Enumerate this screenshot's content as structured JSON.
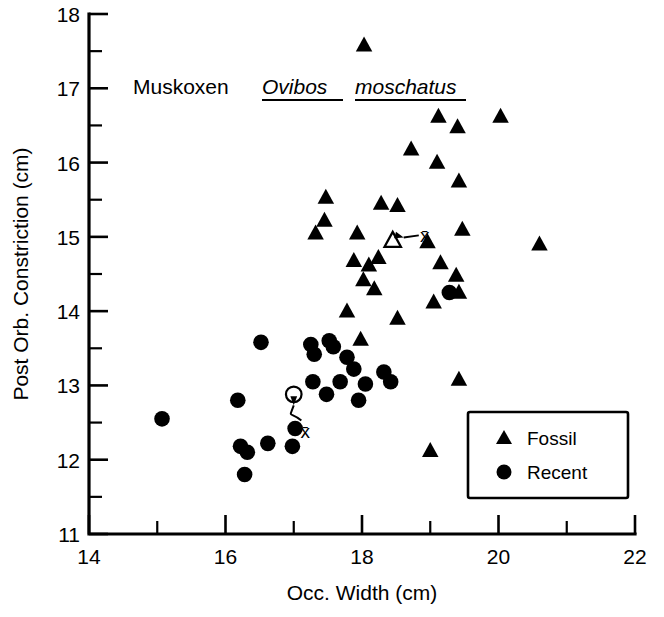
{
  "chart_data": {
    "type": "scatter",
    "title": "Muskoxen Ovibos moschatus",
    "title_plain": "Muskoxen",
    "title_italic": "Ovibos moschatus",
    "title_genus": "Ovibos",
    "title_species": "moschatus",
    "xlabel": "Occ. Width (cm)",
    "ylabel": "Post Orb. Constriction (cm)",
    "xlim": [
      14,
      22
    ],
    "ylim": [
      11,
      18
    ],
    "x_major_ticks": [
      14,
      16,
      18,
      20,
      22
    ],
    "x_minor_ticks": [
      15,
      17,
      19,
      21
    ],
    "x_tick_labels": [
      "14",
      "16",
      "18",
      "20",
      "22"
    ],
    "y_major_ticks": [
      11,
      12,
      13,
      14,
      15,
      16,
      17,
      18
    ],
    "y_minor_ticks": [
      11.5,
      12.5,
      13.5,
      14.5,
      15.5,
      16.5,
      17.5
    ],
    "y_tick_labels": [
      "11",
      "12",
      "13",
      "14",
      "15",
      "16",
      "17",
      "18"
    ],
    "grid": false,
    "legend_position": "bottom-right",
    "series": [
      {
        "name": "Fossil",
        "marker": "triangle",
        "color": "#000000",
        "points": [
          [
            18.03,
            17.58
          ],
          [
            19.12,
            16.62
          ],
          [
            20.03,
            16.62
          ],
          [
            19.4,
            16.48
          ],
          [
            18.72,
            16.18
          ],
          [
            19.1,
            16.0
          ],
          [
            19.42,
            15.75
          ],
          [
            17.47,
            15.53
          ],
          [
            18.28,
            15.45
          ],
          [
            18.52,
            15.42
          ],
          [
            17.45,
            15.22
          ],
          [
            19.47,
            15.1
          ],
          [
            17.32,
            15.05
          ],
          [
            17.93,
            15.05
          ],
          [
            18.96,
            14.93
          ],
          [
            20.6,
            14.9
          ],
          [
            18.24,
            14.72
          ],
          [
            17.88,
            14.68
          ],
          [
            18.1,
            14.62
          ],
          [
            19.15,
            14.65
          ],
          [
            19.38,
            14.48
          ],
          [
            18.02,
            14.42
          ],
          [
            18.18,
            14.3
          ],
          [
            19.42,
            14.25
          ],
          [
            19.05,
            14.12
          ],
          [
            17.78,
            14.0
          ],
          [
            18.52,
            13.9
          ],
          [
            17.98,
            13.62
          ],
          [
            19.42,
            13.08
          ],
          [
            19.0,
            12.12
          ]
        ]
      },
      {
        "name": "Recent",
        "marker": "circle",
        "color": "#000000",
        "points": [
          [
            15.07,
            12.55
          ],
          [
            16.22,
            12.18
          ],
          [
            16.32,
            12.1
          ],
          [
            16.18,
            12.8
          ],
          [
            16.28,
            11.8
          ],
          [
            16.62,
            12.22
          ],
          [
            16.52,
            13.58
          ],
          [
            17.02,
            12.42
          ],
          [
            16.98,
            12.18
          ],
          [
            17.28,
            13.05
          ],
          [
            17.25,
            13.55
          ],
          [
            17.3,
            13.42
          ],
          [
            17.52,
            13.6
          ],
          [
            17.58,
            13.52
          ],
          [
            17.78,
            13.38
          ],
          [
            17.48,
            12.88
          ],
          [
            17.68,
            13.05
          ],
          [
            17.88,
            13.22
          ],
          [
            18.05,
            13.02
          ],
          [
            17.95,
            12.8
          ],
          [
            18.32,
            13.18
          ],
          [
            18.42,
            13.05
          ],
          [
            19.28,
            14.25
          ]
        ]
      }
    ],
    "annotations": [
      {
        "name": "fossil-mean",
        "label": "x̄",
        "marker": "open-triangle",
        "x": 18.45,
        "y": 14.95,
        "label_x": 18.92,
        "label_y": 15.02
      },
      {
        "name": "recent-mean",
        "label": "x̄",
        "marker": "open-circle",
        "x": 17.0,
        "y": 12.88,
        "label_x": 17.17,
        "label_y": 12.38
      }
    ]
  },
  "legend": {
    "items": [
      {
        "symbol": "triangle",
        "label": "Fossil"
      },
      {
        "symbol": "circle",
        "label": "Recent"
      }
    ]
  }
}
